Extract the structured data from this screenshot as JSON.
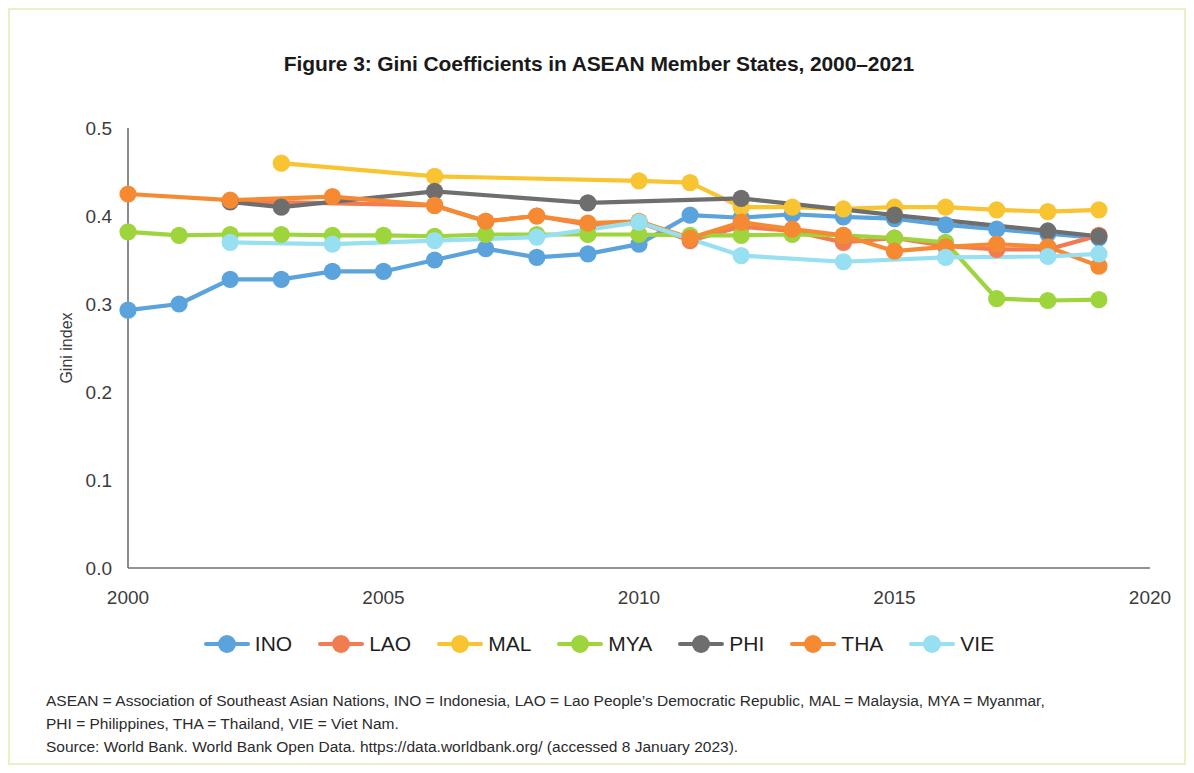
{
  "figure": {
    "title": "Figure 3: Gini Coefficients in ASEAN Member States, 2000–2021",
    "border_color": "#e9f0c4",
    "background": "#ffffff"
  },
  "notes": {
    "line1": "ASEAN = Association of Southeast Asian Nations, INO = Indonesia, LAO = Lao People’s Democratic Republic, MAL = Malaysia, MYA = Myanmar,",
    "line2": "PHI = Philippines, THA = Thailand, VIE = Viet Nam.",
    "line3": "Source: World Bank. World Bank Open Data. https://data.worldbank.org/ (accessed 8 January 2023)."
  },
  "legend": {
    "position": "bottom",
    "items": [
      {
        "label": "INO",
        "color": "#5ba3dc"
      },
      {
        "label": "LAO",
        "color": "#f27c52"
      },
      {
        "label": "MAL",
        "color": "#f9c431"
      },
      {
        "label": "MYA",
        "color": "#9ed43c"
      },
      {
        "label": "PHI",
        "color": "#6e6e6e"
      },
      {
        "label": "THA",
        "color": "#f58a33"
      },
      {
        "label": "VIE",
        "color": "#96e0f2"
      }
    ]
  },
  "chart_data": {
    "type": "line",
    "title": "Figure 3: Gini Coefficients in ASEAN Member States, 2000–2021",
    "xlabel": "",
    "ylabel": "Gini index",
    "xlim": [
      2000,
      2020
    ],
    "ylim": [
      0.0,
      0.5
    ],
    "xticks": [
      "2000",
      "2005",
      "2010",
      "2015",
      "2020"
    ],
    "xtick_values": [
      2000,
      2005,
      2010,
      2015,
      2020
    ],
    "yticks": [
      "0.0",
      "0.1",
      "0.2",
      "0.3",
      "0.4",
      "0.5"
    ],
    "ytick_values": [
      0.0,
      0.1,
      0.2,
      0.3,
      0.4,
      0.5
    ],
    "grid": false,
    "markers": true,
    "series": [
      {
        "name": "INO",
        "color": "#5ba3dc",
        "x": [
          2000,
          2001,
          2002,
          2003,
          2004,
          2005,
          2006,
          2007,
          2008,
          2009,
          2010,
          2011,
          2012,
          2013,
          2014,
          2015,
          2016,
          2017,
          2018,
          2019
        ],
        "y": [
          0.293,
          0.3,
          0.328,
          0.328,
          0.337,
          0.337,
          0.35,
          0.363,
          0.353,
          0.357,
          0.368,
          0.401,
          0.398,
          0.402,
          0.399,
          0.397,
          0.39,
          0.385,
          0.38,
          0.375
        ]
      },
      {
        "name": "LAO",
        "color": "#f27c52",
        "x": [
          2002,
          2006,
          2007,
          2008,
          2009,
          2010,
          2011,
          2012,
          2013,
          2014,
          2015,
          2016,
          2017,
          2018,
          2019
        ],
        "y": [
          0.417,
          0.412,
          0.394,
          0.4,
          0.39,
          0.393,
          0.372,
          0.388,
          0.383,
          0.37,
          0.375,
          0.366,
          0.362,
          0.362,
          0.378
        ]
      },
      {
        "name": "MAL",
        "color": "#f9c431",
        "x": [
          2003,
          2006,
          2010,
          2011,
          2012,
          2013,
          2014,
          2015,
          2016,
          2017,
          2018,
          2019
        ],
        "y": [
          0.46,
          0.445,
          0.44,
          0.438,
          0.41,
          0.41,
          0.408,
          0.41,
          0.41,
          0.407,
          0.405,
          0.407
        ]
      },
      {
        "name": "MYA",
        "color": "#9ed43c",
        "x": [
          2000,
          2001,
          2002,
          2003,
          2004,
          2005,
          2006,
          2007,
          2008,
          2009,
          2010,
          2011,
          2012,
          2013,
          2014,
          2015,
          2016,
          2017,
          2018,
          2019
        ],
        "y": [
          0.382,
          0.378,
          0.379,
          0.379,
          0.378,
          0.378,
          0.377,
          0.379,
          0.379,
          0.379,
          0.379,
          0.378,
          0.378,
          0.379,
          0.378,
          0.375,
          0.37,
          0.306,
          0.304,
          0.305
        ]
      },
      {
        "name": "PHI",
        "color": "#6e6e6e",
        "x": [
          2002,
          2003,
          2006,
          2009,
          2012,
          2015,
          2018,
          2019
        ],
        "y": [
          0.416,
          0.41,
          0.428,
          0.415,
          0.42,
          0.401,
          0.383,
          0.377
        ]
      },
      {
        "name": "THA",
        "color": "#f58a33",
        "x": [
          2000,
          2002,
          2004,
          2006,
          2007,
          2008,
          2009,
          2010,
          2011,
          2012,
          2013,
          2014,
          2015,
          2016,
          2017,
          2018,
          2019
        ],
        "y": [
          0.425,
          0.418,
          0.422,
          0.412,
          0.394,
          0.4,
          0.392,
          0.394,
          0.375,
          0.393,
          0.385,
          0.378,
          0.36,
          0.365,
          0.368,
          0.365,
          0.343
        ]
      },
      {
        "name": "VIE",
        "color": "#96e0f2",
        "x": [
          2002,
          2004,
          2006,
          2008,
          2010,
          2012,
          2014,
          2016,
          2018,
          2019
        ],
        "y": [
          0.37,
          0.368,
          0.372,
          0.376,
          0.393,
          0.355,
          0.348,
          0.353,
          0.354,
          0.357
        ]
      }
    ]
  }
}
